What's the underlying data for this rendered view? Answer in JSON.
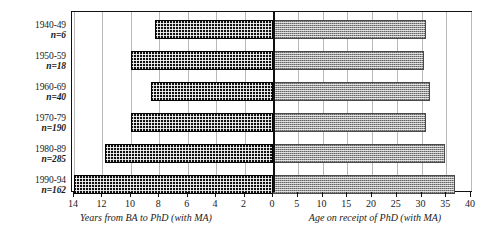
{
  "chart_data": {
    "type": "bar",
    "title": "",
    "subtitle": "",
    "orientation": "horizontal",
    "layout": "back-to-back bidirectional (butterfly) bar chart",
    "grid": true,
    "legend_position": "none",
    "categories": [
      "1940-49",
      "1950-59",
      "1960-69",
      "1970-79",
      "1980-89",
      "1990-94"
    ],
    "category_counts": [
      "n=6",
      "n=18",
      "n=40",
      "n=190",
      "n=285",
      "n=162"
    ],
    "series": [
      {
        "name": "Years from BA to PhD (with MA)",
        "side": "left",
        "axis_label": "Years from BA to PhD (with MA)",
        "xlim": [
          14,
          0
        ],
        "ticks": [
          14,
          12,
          10,
          8,
          6,
          4,
          2,
          0
        ],
        "values": [
          8.3,
          10.0,
          8.6,
          10.0,
          11.8,
          14.0
        ],
        "fill": "dark-speckled",
        "color": "#111111"
      },
      {
        "name": "Age on receipt of PhD (with MA)",
        "side": "right",
        "axis_label": "Age on receipt of PhD (with MA)",
        "xlim": [
          0,
          40
        ],
        "ticks": [
          0,
          5,
          10,
          15,
          20,
          25,
          30,
          35,
          40
        ],
        "values": [
          30.8,
          30.5,
          31.7,
          30.8,
          34.7,
          36.7
        ],
        "fill": "gray-checkered",
        "color": "#9a9a9a"
      }
    ],
    "left_axis_label": "Years from BA to PhD (with MA)",
    "right_axis_label": "Age on receipt of PhD (with MA)",
    "left_ticklabels": [
      "14",
      "12",
      "10",
      "8",
      "6",
      "4",
      "2",
      "0"
    ],
    "right_ticklabels": [
      "5",
      "10",
      "15",
      "20",
      "25",
      "30",
      "35",
      "40"
    ],
    "ylabel": ""
  }
}
